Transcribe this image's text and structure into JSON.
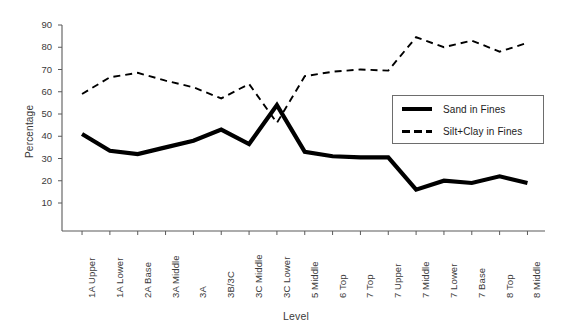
{
  "chart_data": {
    "type": "line",
    "title": "",
    "subtitle": "",
    "xlabel": "Level",
    "ylabel": "Percentage",
    "ylim": [
      0,
      90
    ],
    "yticks": [
      10,
      20,
      30,
      40,
      50,
      60,
      70,
      80,
      90
    ],
    "grid": false,
    "legend_position": "center-right",
    "categories": [
      "1A Upper",
      "1A Lower",
      "2A Base",
      "3A Middle",
      "3A",
      "3B/3C",
      "3C Middle",
      "3C Lower",
      "5 Middle",
      "6 Top",
      "7 Top",
      "7 Upper",
      "7 Middle",
      "7 Lower",
      "7 Base",
      "8 Top",
      "8 Middle"
    ],
    "series": [
      {
        "name": "Sand in Fines",
        "style": "solid",
        "color": "#000000",
        "values": [
          41,
          33.5,
          32,
          35,
          38,
          43,
          36.5,
          54,
          33,
          31,
          30.5,
          30.5,
          16,
          20,
          19,
          22,
          19
        ]
      },
      {
        "name": "Silt+Clay in Fines",
        "style": "dashed",
        "color": "#000000",
        "values": [
          59,
          66.5,
          68.5,
          65,
          62,
          57,
          63.5,
          46,
          67,
          69,
          70,
          69.5,
          84.5,
          80,
          83,
          78,
          82
        ]
      }
    ]
  },
  "axis": {
    "y_title": "Percentage",
    "x_title": "Level"
  },
  "legend": {
    "entries": [
      {
        "label": "Sand in Fines",
        "style": "solid"
      },
      {
        "label": "Silt+Clay in Fines",
        "style": "dashed"
      }
    ]
  }
}
